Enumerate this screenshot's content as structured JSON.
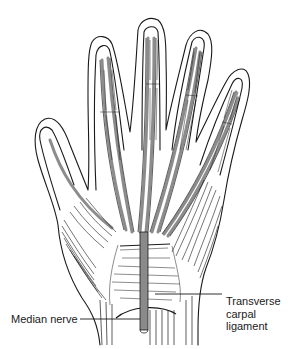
{
  "figure": {
    "style": "black and white line illustration",
    "colors": {
      "background": "#ffffff",
      "outline": "#1a1a1a",
      "tendon_fill": "#8c8c8c",
      "nerve_fill": "#8a8a8a"
    }
  },
  "labels": {
    "median_nerve": "Median nerve",
    "transverse_carpal_ligament": {
      "line1": "Transverse",
      "line2": "carpal",
      "line3": "ligament"
    }
  }
}
